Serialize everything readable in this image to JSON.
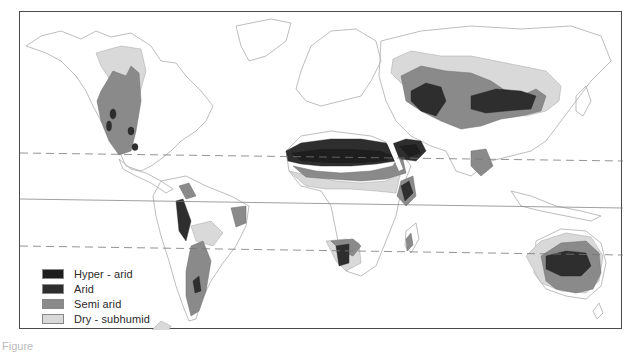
{
  "map": {
    "type": "thematic world map",
    "subject": "World drylands by aridity class",
    "reference_lines": [
      "Tropic of Cancer (dashed)",
      "Equator (solid)",
      "Tropic of Capricorn (dashed)"
    ]
  },
  "legend": {
    "items": [
      {
        "label": "Hyper - arid",
        "color": "#1e1e1e"
      },
      {
        "label": "Arid",
        "color": "#2e2e2e"
      },
      {
        "label": "Semi   arid",
        "color": "#8a8a8a"
      },
      {
        "label": "Dry - subhumid",
        "color": "#d9d9d9"
      }
    ]
  },
  "colors": {
    "land_outline": "#b5b5b5",
    "hyper_arid": "#1e1e1e",
    "arid": "#2e2e2e",
    "semi_arid": "#8a8a8a",
    "dry_subhumid": "#d9d9d9",
    "frame": "#4a4a4a"
  },
  "caption": {
    "text": "Figure"
  }
}
